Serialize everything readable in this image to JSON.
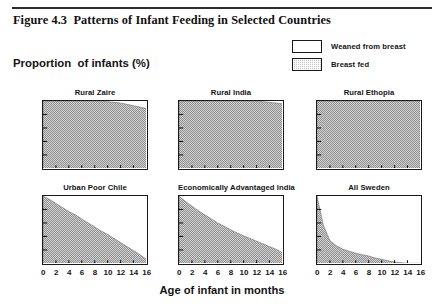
{
  "figure": {
    "title": "Figure 4.3  Patterns of Infant Feeding in Selected Countries",
    "y_axis_title": "Proportion  of infants (%)",
    "x_axis_title": "Age of infant in months"
  },
  "legend": {
    "position": "top-right",
    "items": [
      {
        "label": "Weaned from breast",
        "swatch": "white",
        "color": "#ffffff"
      },
      {
        "label": "Breast fed",
        "swatch": "stippled-gray",
        "color": "#c9c9c9"
      }
    ]
  },
  "xticks": [
    "0",
    "2",
    "4",
    "6",
    "8",
    "10",
    "12",
    "14",
    "16"
  ],
  "chart_data": {
    "type": "area",
    "title": "Figure 4.3  Patterns of Infant Feeding in Selected Countries",
    "xlabel": "Age of infant in months",
    "ylabel": "Proportion  of infants (%)",
    "xlim": [
      0,
      16
    ],
    "ylim": [
      0,
      100
    ],
    "grid": false,
    "legend": [
      "Weaned from breast",
      "Breast fed"
    ],
    "x": [
      0,
      1,
      2,
      3,
      4,
      5,
      6,
      7,
      8,
      9,
      10,
      11,
      12,
      13,
      14,
      15,
      16
    ],
    "panels": [
      {
        "name": "Rural Zaire",
        "series": "Breast fed",
        "values": [
          100,
          100,
          100,
          100,
          100,
          100,
          100,
          100,
          100,
          100,
          99,
          98,
          97,
          95,
          93,
          91,
          89
        ]
      },
      {
        "name": "Rural India",
        "series": "Breast fed",
        "values": [
          100,
          100,
          100,
          100,
          100,
          100,
          100,
          100,
          100,
          100,
          100,
          100,
          100,
          99,
          98,
          97,
          96
        ]
      },
      {
        "name": "Rural Ethopia",
        "series": "Breast fed",
        "values": [
          100,
          100,
          100,
          100,
          100,
          100,
          100,
          100,
          100,
          100,
          100,
          100,
          100,
          100,
          100,
          100,
          100
        ]
      },
      {
        "name": "Urban Poor Chile",
        "series": "Breast fed",
        "values": [
          100,
          95,
          89,
          83,
          77,
          72,
          66,
          60,
          54,
          48,
          43,
          37,
          31,
          25,
          19,
          13,
          6
        ]
      },
      {
        "name": "Economically Advantaged India",
        "series": "Breast fed",
        "values": [
          100,
          92,
          85,
          78,
          72,
          66,
          60,
          55,
          50,
          45,
          41,
          37,
          33,
          29,
          25,
          21,
          16
        ]
      },
      {
        "name": "All Sweden",
        "series": "Breast fed",
        "values": [
          100,
          56,
          34,
          26,
          21,
          18,
          15,
          13,
          11,
          8,
          6,
          4,
          2,
          1,
          0,
          0,
          0
        ]
      }
    ]
  },
  "panel_titles": {
    "zaire": "Rural Zaire",
    "india": "Rural India",
    "ethopia": "Rural Ethopia",
    "chile": "Urban Poor Chile",
    "adv_india": "Economically Advantaged India",
    "sweden": "All Sweden"
  }
}
